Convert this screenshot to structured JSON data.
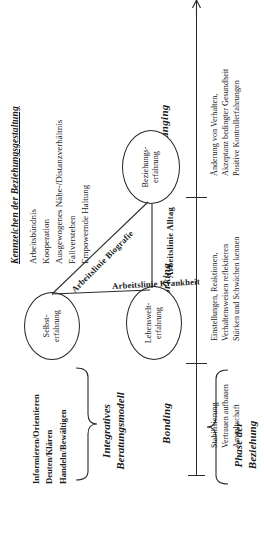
{
  "figure": {
    "title": "Integratives Beratungsmodell",
    "orientation": "rotated-90-ccw"
  },
  "model_label": {
    "line1": "Integratives",
    "line2": "Beratungsmodell",
    "items": [
      "Informieren/Orientieren",
      "Deuten/Klären",
      "Handeln/Bewältigen"
    ]
  },
  "phase_axis_label": {
    "line1": "Phase der",
    "line2": "Beziehung"
  },
  "phases": [
    {
      "name": "Bonding",
      "details": [
        "Stabilisierung",
        "Vertrauen aufbauen",
        "Anwaltschaft"
      ]
    },
    {
      "name": "Working",
      "details": [
        "Einstellungen, Reaktionen,",
        "Verhaltensweisen reflektieren",
        "Stärken und Schwächen kennen"
      ]
    },
    {
      "name": "Changing",
      "details": [
        "Änderung von Verhalten,",
        "Akzeptanz bedingter Gesundheit",
        "Positive Kontrollerfahrungen"
      ]
    }
  ],
  "nodes": [
    {
      "id": "selbst",
      "line1": "Selbst-",
      "line2": "erfahrung"
    },
    {
      "id": "beziehung",
      "line1": "Beziehungs-",
      "line2": "erfahrung"
    },
    {
      "id": "lebenswelt",
      "line1": "Lebenswelt-",
      "line2": "erfahrung"
    }
  ],
  "work_lines": [
    {
      "id": "biografie",
      "label": "Arbeitslinie Biografie"
    },
    {
      "id": "krankheit",
      "label": "Arbeitslinie Krankheit"
    },
    {
      "id": "alltag",
      "label": "Arbeitslinie Alltag"
    }
  ],
  "kennzeichen": {
    "title": "Kennzeichen der Beziehungsgestaltung",
    "items": [
      "Arbeitsbündnis",
      "Kooperation",
      "Ausgewogenes Nähe-/Distanzverhältnis",
      "Fallverstehen",
      "Empowernde Haltung"
    ]
  },
  "colors": {
    "ink": "#1a1a1a",
    "line": "#2b2b2b",
    "background": "#ffffff"
  }
}
